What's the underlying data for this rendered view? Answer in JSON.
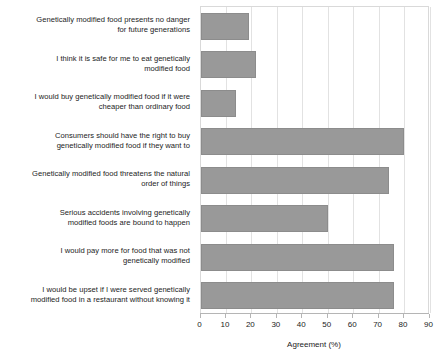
{
  "chart_data": {
    "type": "bar",
    "orientation": "horizontal",
    "title": "",
    "xlabel": "Agreement (%)",
    "ylabel": "",
    "xlim": [
      0,
      90
    ],
    "xticks": [
      0,
      10,
      20,
      30,
      40,
      50,
      60,
      70,
      80,
      90
    ],
    "grid": true,
    "legend": null,
    "bar_color": "#999999",
    "categories": [
      "Genetically modified food presents no danger\nfor future generations",
      "I think it is safe for me to eat genetically\nmodified food",
      "I would buy genetically modified food if it were\ncheaper than ordinary food",
      "Consumers should have the right to buy\ngenetically modified food if they want to",
      "Genetically modified food threatens the natural\norder of things",
      "Serious accidents involving genetically\nmodified foods are bound to happen",
      "I would pay more for food that was not\ngenetically modified",
      "I would be upset if I were served genetically\nmodified food in a restaurant without knowing it"
    ],
    "values": [
      19,
      22,
      14,
      80,
      74,
      50,
      76,
      76
    ]
  }
}
